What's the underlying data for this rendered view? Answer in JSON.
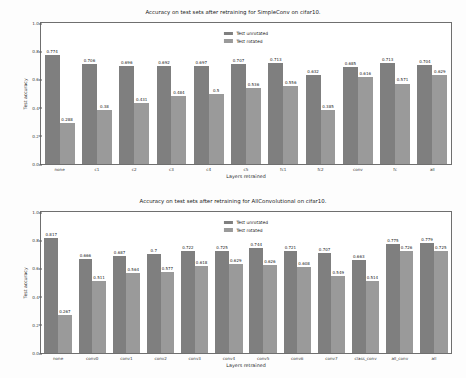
{
  "figures": [
    {
      "id": "simpleconv",
      "chart_data": {
        "type": "bar",
        "title": "Accuracy on test sets after retraining for SimpleConv on cifar10.",
        "xlabel": "Layers retrained",
        "ylabel": "Test accuracy",
        "ylim": [
          0.0,
          1.0
        ],
        "yticks": [
          "0.0",
          "0.2",
          "0.4",
          "0.6",
          "0.8",
          "1.0"
        ],
        "ytickvals": [
          0.0,
          0.2,
          0.4,
          0.6,
          0.8,
          1.0
        ],
        "grid": false,
        "legend_position": "upper center",
        "categories": [
          "none",
          "c1",
          "c2",
          "c3",
          "c4",
          "c5",
          "fc1",
          "fc2",
          "conv",
          "fc",
          "all"
        ],
        "series": [
          {
            "name": "Test unrotated",
            "color": "#7f7f7f",
            "values": [
              0.774,
              0.706,
              0.696,
              0.692,
              0.697,
              0.707,
              0.713,
              0.632,
              0.685,
              0.713,
              0.704
            ],
            "labels": [
              "0.774",
              "0.706",
              "0.696",
              "0.692",
              "0.697",
              "0.707",
              "0.713",
              "0.632",
              "0.685",
              "0.713",
              "0.704"
            ]
          },
          {
            "name": "Test rotated",
            "color": "#9a9a9a",
            "values": [
              0.288,
              0.38,
              0.431,
              0.484,
              0.5,
              0.536,
              0.556,
              0.385,
              0.616,
              0.571,
              0.629
            ],
            "labels": [
              "0.288",
              "0.38",
              "0.431",
              "0.484",
              "0.5",
              "0.536",
              "0.556",
              "0.385",
              "0.616",
              "0.571",
              "0.629"
            ]
          }
        ]
      }
    },
    {
      "id": "allconvolutional",
      "chart_data": {
        "type": "bar",
        "title": "Accuracy on test sets after retraining for AllConvolutional on cifar10.",
        "xlabel": "Layers retrained",
        "ylabel": "Test accuracy",
        "ylim": [
          0.0,
          1.0
        ],
        "yticks": [
          "0.0",
          "0.2",
          "0.4",
          "0.6",
          "0.8",
          "1.0"
        ],
        "ytickvals": [
          0.0,
          0.2,
          0.4,
          0.6,
          0.8,
          1.0
        ],
        "grid": false,
        "legend_position": "upper center",
        "categories": [
          "none",
          "conv0",
          "conv1",
          "conv2",
          "conv3",
          "conv4",
          "conv5",
          "conv6",
          "conv7",
          "class_conv",
          "all_conv",
          "all"
        ],
        "series": [
          {
            "name": "Test unrotated",
            "color": "#7f7f7f",
            "values": [
              0.817,
              0.666,
              0.687,
              0.7,
              0.722,
              0.725,
              0.744,
              0.721,
              0.707,
              0.663,
              0.775,
              0.779
            ],
            "labels": [
              "0.817",
              "0.666",
              "0.687",
              "0.7",
              "0.722",
              "0.725",
              "0.744",
              "0.721",
              "0.707",
              "0.663",
              "0.775",
              "0.779"
            ]
          },
          {
            "name": "Test rotated",
            "color": "#9a9a9a",
            "values": [
              0.267,
              0.511,
              0.564,
              0.577,
              0.618,
              0.629,
              0.626,
              0.608,
              0.549,
              0.514,
              0.726,
              0.725
            ],
            "labels": [
              "0.267",
              "0.511",
              "0.564",
              "0.577",
              "0.618",
              "0.629",
              "0.626",
              "0.608",
              "0.549",
              "0.514",
              "0.726",
              "0.725"
            ]
          }
        ]
      }
    }
  ]
}
